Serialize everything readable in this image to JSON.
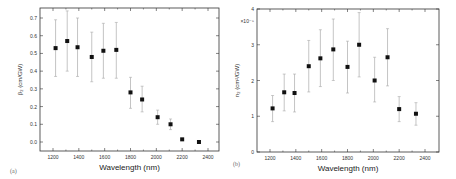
{
  "chart_data": [
    {
      "type": "scatter",
      "panel_label": "(a)",
      "title": "",
      "xlabel": "Wavelength (nm)",
      "ylabel": "β₂ (cm/GW)",
      "xlim": [
        1100,
        2500
      ],
      "ylim": [
        -0.05,
        0.75
      ],
      "xticks": [
        1200,
        1400,
        1600,
        1800,
        2000,
        2200,
        2400
      ],
      "yticks": [
        0.0,
        0.1,
        0.2,
        0.3,
        0.4,
        0.5,
        0.6,
        0.7
      ],
      "ytick_labels": [
        "0.0",
        "0.1",
        "0.2",
        "0.3",
        "0.4",
        "0.5",
        "0.6",
        "0.7"
      ],
      "grid": false,
      "legend": null,
      "series": [
        {
          "name": "beta2",
          "x": [
            1220,
            1310,
            1390,
            1500,
            1590,
            1690,
            1800,
            1890,
            2010,
            2110,
            2200,
            2330
          ],
          "y": [
            0.53,
            0.57,
            0.535,
            0.48,
            0.515,
            0.52,
            0.28,
            0.24,
            0.14,
            0.1,
            0.015,
            0.0
          ],
          "err_low": [
            0.37,
            0.4,
            0.37,
            0.34,
            0.36,
            0.36,
            0.19,
            0.17,
            0.1,
            0.07,
            0.015,
            0.0
          ],
          "err_high": [
            0.69,
            0.74,
            0.7,
            0.62,
            0.67,
            0.675,
            0.365,
            0.315,
            0.18,
            0.13,
            0.015,
            0.0
          ]
        }
      ]
    },
    {
      "type": "scatter",
      "panel_label": "(b)",
      "title": "",
      "xlabel": "Wavelength (nm)",
      "ylabel": "n₂ (cm²/GW)",
      "y_multiplier": "×10⁻⁵",
      "xlim": [
        1100,
        2500
      ],
      "ylim": [
        0,
        4
      ],
      "xticks": [
        1200,
        1400,
        1600,
        1800,
        2000,
        2200,
        2400
      ],
      "yticks": [
        0,
        1,
        2,
        3,
        4
      ],
      "ytick_labels": [
        "0",
        "1",
        "2",
        "3",
        "4"
      ],
      "grid": false,
      "legend": null,
      "series": [
        {
          "name": "n2",
          "x": [
            1220,
            1310,
            1390,
            1500,
            1590,
            1690,
            1800,
            1890,
            2010,
            2110,
            2200,
            2330
          ],
          "y": [
            1.22,
            1.67,
            1.65,
            2.4,
            2.62,
            2.87,
            2.38,
            3.0,
            2.0,
            2.65,
            1.2,
            1.07
          ],
          "err_low": [
            0.85,
            1.15,
            1.12,
            1.68,
            1.83,
            2.0,
            1.65,
            2.1,
            1.4,
            1.85,
            0.85,
            0.75
          ],
          "err_high": [
            1.58,
            2.18,
            2.18,
            3.12,
            3.42,
            3.72,
            3.1,
            3.9,
            2.65,
            3.45,
            1.55,
            1.38
          ]
        }
      ]
    }
  ],
  "panels": {
    "a": {
      "label": "(a)",
      "xlabel": "Wavelength (nm)",
      "ylabel": "β₂ (cm/GW)"
    },
    "b": {
      "label": "(b)",
      "xlabel": "Wavelength (nm)",
      "ylabel": "n₂ (cm²/GW)",
      "multiplier": "×10⁻⁵"
    }
  }
}
